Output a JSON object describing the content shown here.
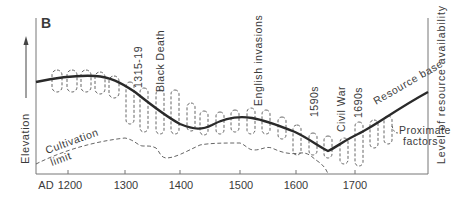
{
  "panel_label": "B",
  "y_axis_left_label": "Elevation",
  "y_axis_right_label": "Level of resource availability",
  "x_axis": {
    "prefix": "AD",
    "ticks": [
      "1200",
      "1300",
      "1400",
      "1500",
      "1600",
      "1700"
    ]
  },
  "curves": {
    "resource_base": "Resource base",
    "cultivation_limit_line1": "Cultivation",
    "cultivation_limit_line2": "limit",
    "proximate_factors_line1": "Proximate",
    "proximate_factors_line2": "factors"
  },
  "events": [
    {
      "label": "1315-19"
    },
    {
      "label": "Black Death"
    },
    {
      "label": "English invasions"
    },
    {
      "label": "1590s"
    },
    {
      "label": "Civil War"
    },
    {
      "label": "1690s"
    }
  ],
  "colors": {
    "line": "#2a2a2a",
    "dashed": "#555555",
    "axis": "#666666",
    "text": "#3a3a3a"
  }
}
